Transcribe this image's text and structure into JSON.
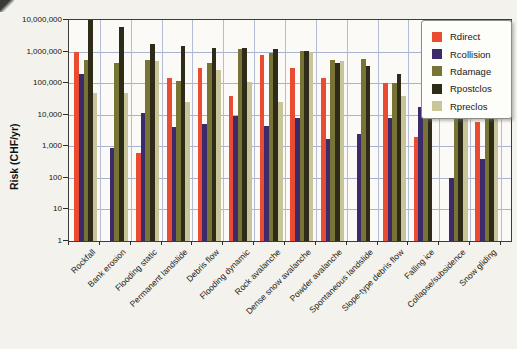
{
  "page": {
    "background": "#f3f2ec"
  },
  "chart_data": {
    "type": "bar",
    "title": "",
    "ylabel": "Risk (CHF/yr)",
    "xlabel": "",
    "y_scale": "log",
    "ylim": [
      1,
      10000000
    ],
    "y_tick_labels": [
      "10,000,000",
      "1,000,000",
      "100,000",
      "10,000",
      "1,000",
      "100",
      "10",
      "1"
    ],
    "grid": true,
    "gridline_color": "#a9b3ce",
    "axis_color": "#3c3c3a",
    "legend_position": "top-right",
    "categories": [
      "Rockfall",
      "Bank erosion",
      "Flooding static",
      "Permanent landslide",
      "Debris flow",
      "Flooding dynamic",
      "Rock avalanche",
      "Dense snow avalanche",
      "Powder avalanche",
      "Spontaneous landslide",
      "Slope-type debris flow",
      "Falling ice",
      "Collapse/subsidence",
      "Snow gliding"
    ],
    "series": [
      {
        "name": "Rdirect",
        "color": "#e94c33",
        "values": [
          1000000,
          null,
          600,
          150000,
          300000,
          40000,
          800000,
          300000,
          150000,
          null,
          100000,
          2000,
          null,
          6000
        ]
      },
      {
        "name": "Rcollision",
        "color": "#3d2a6b",
        "values": [
          200000,
          900,
          11000,
          4000,
          5000,
          9000,
          4500,
          8000,
          1700,
          2500,
          8000,
          18000,
          100,
          400
        ]
      },
      {
        "name": "Rdamage",
        "color": "#777436",
        "values": [
          550000,
          450000,
          550000,
          120000,
          450000,
          1200000,
          900000,
          1050000,
          550000,
          600000,
          100000,
          15000,
          1000000,
          1000000
        ]
      },
      {
        "name": "Rpostclos",
        "color": "#2e2c19",
        "values": [
          10000000,
          6000000,
          1800000,
          1500000,
          1300000,
          1300000,
          1200000,
          1050000,
          450000,
          350000,
          200000,
          14000,
          1000000,
          1000000
        ]
      },
      {
        "name": "Rpreclos",
        "color": "#c9c59a",
        "values": [
          50000,
          50000,
          500000,
          25000,
          270000,
          110000,
          25000,
          950000,
          500000,
          null,
          40000,
          null,
          1000000,
          1000000
        ]
      }
    ]
  }
}
